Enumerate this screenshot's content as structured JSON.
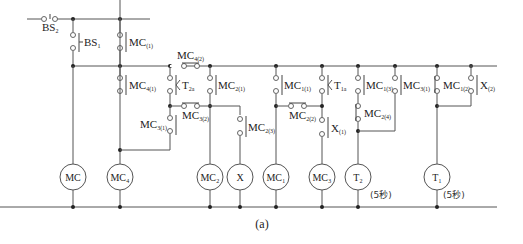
{
  "diagram": {
    "type": "relay-ladder-diagram",
    "caption": "(a)",
    "colors": {
      "wire": "#555555",
      "junction": "#222222",
      "background": "#ffffff"
    },
    "contacts": {
      "bs2": {
        "main": "BS",
        "sub": "2"
      },
      "bs1": {
        "main": "BS",
        "sub": "1"
      },
      "mc1_top": {
        "main": "MC",
        "sub": "(1)"
      },
      "mc4_1": {
        "main": "MC",
        "sub": "4(1)"
      },
      "mc4_2": {
        "main": "MC",
        "sub": "4(2)"
      },
      "t2a": {
        "main": "T",
        "sub": "2a"
      },
      "mc2_1": {
        "main": "MC",
        "sub": "2(1)"
      },
      "mc3_1": {
        "main": "MC",
        "sub": "3(1)"
      },
      "mc3_2": {
        "main": "MC",
        "sub": "3(2)"
      },
      "mc2_3": {
        "main": "MC",
        "sub": "2(3)"
      },
      "mc1_1": {
        "main": "MC",
        "sub": "1(1)"
      },
      "mc2_2": {
        "main": "MC",
        "sub": "2(2)"
      },
      "t1a": {
        "main": "T",
        "sub": "1a"
      },
      "x1": {
        "main": "X",
        "sub": "(1)"
      },
      "mc1_3": {
        "main": "MC",
        "sub": "1(3)"
      },
      "mc2_4": {
        "main": "MC",
        "sub": "2(4)"
      },
      "mc3_1b": {
        "main": "MC",
        "sub": "3(1)"
      },
      "mc1_2": {
        "main": "MC",
        "sub": "1(2)"
      },
      "x2": {
        "main": "X",
        "sub": "(2)"
      }
    },
    "coils": {
      "mc": "MC",
      "mc4": "MC₄",
      "mc2": "MC₂",
      "x": "X",
      "mc1": "MC₁",
      "mc3": "MC₃",
      "t2": "T₂",
      "t1": "T₁"
    },
    "timer_notes": {
      "t2": "(5秒)",
      "t1": "(5秒)"
    }
  }
}
